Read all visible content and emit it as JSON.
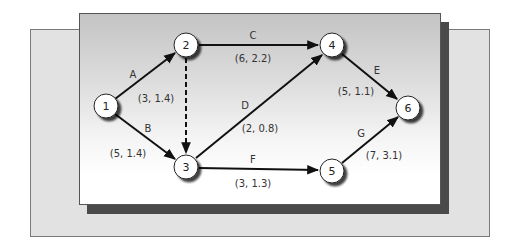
{
  "diagram": {
    "type": "activity-on-arrow network",
    "colors": {
      "back_panel": "#e2e2e2",
      "front_panel_top": "#c4c4c4",
      "front_panel_bottom": "#ffffff",
      "shadow": "#4a4a4a",
      "edge": "#111111",
      "node_fill": "#ffffff"
    },
    "nodes": [
      {
        "id": "1",
        "label": "1",
        "x": 106,
        "y": 106
      },
      {
        "id": "2",
        "label": "2",
        "x": 186,
        "y": 45
      },
      {
        "id": "3",
        "label": "3",
        "x": 186,
        "y": 167
      },
      {
        "id": "4",
        "label": "4",
        "x": 332,
        "y": 45
      },
      {
        "id": "5",
        "label": "5",
        "x": 332,
        "y": 171
      },
      {
        "id": "6",
        "label": "6",
        "x": 408,
        "y": 108
      }
    ],
    "edges": [
      {
        "id": "A",
        "from": "1",
        "to": "2",
        "label": "A",
        "estimate": "(3, 1.4)",
        "dashed": false
      },
      {
        "id": "B",
        "from": "1",
        "to": "3",
        "label": "B",
        "estimate": "(5, 1.4)",
        "dashed": false
      },
      {
        "id": "dummy",
        "from": "2",
        "to": "3",
        "label": "",
        "estimate": "",
        "dashed": true
      },
      {
        "id": "C",
        "from": "2",
        "to": "4",
        "label": "C",
        "estimate": "(6, 2.2)",
        "dashed": false
      },
      {
        "id": "D",
        "from": "3",
        "to": "4",
        "label": "D",
        "estimate": "(2, 0.8)",
        "dashed": false
      },
      {
        "id": "E",
        "from": "4",
        "to": "6",
        "label": "E",
        "estimate": "(5, 1.1)",
        "dashed": false
      },
      {
        "id": "F",
        "from": "3",
        "to": "5",
        "label": "F",
        "estimate": "(3, 1.3)",
        "dashed": false
      },
      {
        "id": "G",
        "from": "5",
        "to": "6",
        "label": "G",
        "estimate": "(7, 3.1)",
        "dashed": false
      }
    ]
  }
}
